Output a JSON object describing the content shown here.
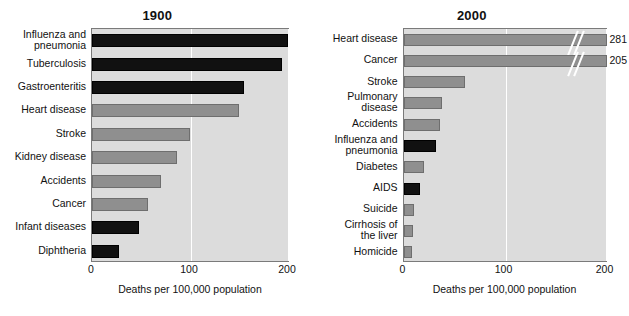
{
  "figure": {
    "axis_title": "Deaths per 100,000 population"
  },
  "chart_data": [
    {
      "type": "bar",
      "title": "1900",
      "orientation": "horizontal",
      "xlabel": "Deaths per 100,000 population",
      "ylabel": "",
      "xlim": [
        0,
        200
      ],
      "xticks": [
        "0",
        "100",
        "200"
      ],
      "xtick_values": [
        0,
        100,
        200
      ],
      "grid": "vertical-white-at-100-and-200",
      "legend": "none",
      "categories": [
        "Influenza and\npneumonia",
        "Tuberculosis",
        "Gastroenteritis",
        "Heart disease",
        "Stroke",
        "Kidney disease",
        "Accidents",
        "Cancer",
        "Infant diseases",
        "Diphtheria"
      ],
      "values": [
        200,
        194,
        155,
        150,
        100,
        87,
        70,
        57,
        48,
        28
      ],
      "bar_colors": [
        "#111111",
        "#111111",
        "#111111",
        "#8f8f8f",
        "#8f8f8f",
        "#8f8f8f",
        "#8f8f8f",
        "#8f8f8f",
        "#111111",
        "#111111"
      ],
      "value_labels": [
        "",
        "",
        "",
        "",
        "",
        "",
        "",
        "",
        "",
        ""
      ]
    },
    {
      "type": "bar",
      "title": "2000",
      "orientation": "horizontal",
      "xlabel": "Deaths per 100,000 population",
      "ylabel": "",
      "xlim": [
        0,
        200
      ],
      "xticks": [
        "0",
        "100",
        "200"
      ],
      "xtick_values": [
        0,
        100,
        200
      ],
      "grid": "vertical-white-at-100-and-200",
      "legend": "none",
      "categories": [
        "Heart disease",
        "Cancer",
        "Stroke",
        "Pulmonary\ndisease",
        "Accidents",
        "Influenza and\npneumonia",
        "Diabetes",
        "AIDS",
        "Suicide",
        "Cirrhosis of\nthe liver",
        "Homicide"
      ],
      "values": [
        281,
        205,
        61,
        38,
        36,
        32,
        20,
        16,
        10,
        9,
        8
      ],
      "bar_colors": [
        "#8f8f8f",
        "#8f8f8f",
        "#8f8f8f",
        "#8f8f8f",
        "#8f8f8f",
        "#111111",
        "#8f8f8f",
        "#111111",
        "#8f8f8f",
        "#8f8f8f",
        "#8f8f8f"
      ],
      "value_labels": [
        "281",
        "205",
        "",
        "",
        "",
        "",
        "",
        "",
        "",
        "",
        ""
      ],
      "axis_breaks": [
        {
          "category": "Heart disease",
          "note": "double-slash break mark"
        },
        {
          "category": "Cancer",
          "note": "double-slash break mark"
        }
      ]
    }
  ],
  "colors": {
    "plot_background": "#dcdcdc",
    "page_background": "#ffffff",
    "bar_dark": "#111111",
    "bar_grey": "#8f8f8f",
    "gridline": "#ffffff",
    "axis_border": "#7a7a7a",
    "text": "#111111"
  }
}
